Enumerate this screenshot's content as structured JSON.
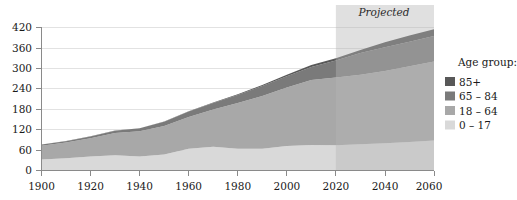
{
  "chart_data": {
    "type": "area",
    "stacked": true,
    "title": "",
    "xlabel": "",
    "ylabel": "",
    "xlim": [
      1900,
      2060
    ],
    "ylim": [
      0,
      420
    ],
    "xticks": [
      1900,
      1920,
      1940,
      1960,
      1980,
      2000,
      2020,
      2040,
      2060
    ],
    "yticks": [
      0,
      60,
      120,
      180,
      240,
      300,
      360,
      420
    ],
    "grid": true,
    "legend_position": "right",
    "legend_title": "Age group:",
    "x": [
      1900,
      1910,
      1920,
      1930,
      1940,
      1950,
      1960,
      1970,
      1980,
      1990,
      2000,
      2010,
      2020,
      2030,
      2040,
      2050,
      2060
    ],
    "series": [
      {
        "name": "0 – 17",
        "color": "#d9d9d9",
        "values": [
          32,
          36,
          41,
          45,
          41,
          47,
          64,
          70,
          64,
          64,
          72,
          75,
          74,
          77,
          80,
          84,
          88
        ]
      },
      {
        "name": "18 – 64",
        "color": "#a8a8a8",
        "values": [
          41,
          46,
          54,
          65,
          74,
          84,
          93,
          109,
          134,
          155,
          172,
          191,
          199,
          204,
          212,
          222,
          232
        ]
      },
      {
        "name": "65 – 84",
        "color": "#7a7a7a",
        "values": [
          3,
          4,
          5,
          7,
          9,
          12,
          16,
          19,
          24,
          29,
          33,
          38,
          50,
          64,
          70,
          72,
          75
        ]
      },
      {
        "name": "85+",
        "color": "#585858",
        "values": [
          0.2,
          0.3,
          0.4,
          0.5,
          0.4,
          0.6,
          0.9,
          1.4,
          2.2,
          3.0,
          4.2,
          5.5,
          6.7,
          9.0,
          14.5,
          18.5,
          19.5
        ]
      }
    ],
    "totals": [
      76,
      86,
      100,
      117,
      124,
      144,
      174,
      199,
      224,
      251,
      281,
      309,
      330,
      354,
      376,
      396,
      414
    ],
    "annotations": [
      {
        "text": "Projected",
        "x_start": 2020,
        "x_end": 2060,
        "shade_color": "#b4b4b4",
        "style": "italic"
      }
    ]
  },
  "legend": {
    "title": "Age group:",
    "items": [
      {
        "label": "85+",
        "color": "#585858"
      },
      {
        "label": "65 – 84",
        "color": "#7a7a7a"
      },
      {
        "label": "18 – 64",
        "color": "#a8a8a8"
      },
      {
        "label": "0 – 17",
        "color": "#d9d9d9"
      }
    ]
  },
  "axes": {
    "y_labels": [
      "420",
      "360",
      "300",
      "240",
      "180",
      "120",
      "60",
      "0"
    ],
    "x_labels": [
      "1900",
      "1920",
      "1940",
      "1960",
      "1980",
      "2000",
      "2020",
      "2040",
      "2060"
    ]
  },
  "projected": {
    "label": "Projected"
  }
}
